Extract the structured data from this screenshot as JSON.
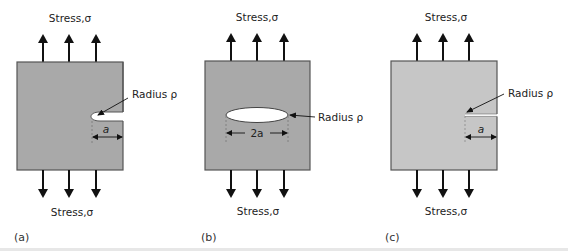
{
  "figure": {
    "panels": [
      {
        "id": "a",
        "caption": "(a)",
        "top_label": "Stress,σ",
        "bottom_label": "Stress,σ",
        "radius_label": "Radius ρ",
        "dimension_label": "a",
        "defect": "edge notch (rounded)",
        "fill": "#a9a9a9"
      },
      {
        "id": "b",
        "caption": "(b)",
        "top_label": "Stress,σ",
        "bottom_label": "Stress,σ",
        "radius_label": "Radius ρ",
        "dimension_label": "2a",
        "defect": "internal elliptical hole",
        "fill": "#a9a9a9"
      },
      {
        "id": "c",
        "caption": "(c)",
        "top_label": "Stress,σ",
        "bottom_label": "Stress,σ",
        "radius_label": "Radius ρ",
        "dimension_label": "a",
        "defect": "sharp edge crack",
        "fill": "#c6c6c6"
      }
    ],
    "colors": {
      "outline": "#555555",
      "arrow": "#111111",
      "hole": "#ffffff",
      "text": "#222222"
    }
  }
}
